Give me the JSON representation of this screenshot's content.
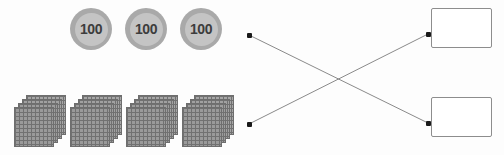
{
  "worksheet": {
    "background_color": "#fdfdfd",
    "width": 504,
    "height": 155
  },
  "coins": {
    "group_name": "hundred-coins",
    "count": 3,
    "face_color": "#c4c4c4",
    "rim_color": "#a9a9a9",
    "text_color": "#3d3d3d",
    "items": [
      {
        "value": "100",
        "x": 70,
        "y": 8
      },
      {
        "value": "100",
        "x": 125,
        "y": 8
      },
      {
        "value": "100",
        "x": 180,
        "y": 8
      }
    ]
  },
  "blocks": {
    "group_name": "hundred-flats",
    "count": 4,
    "rows": 10,
    "columns": 10,
    "fill_color": "#9a9a9a",
    "grid_line_color": "#717171",
    "items": [
      {
        "x": 14,
        "y": 95
      },
      {
        "x": 70,
        "y": 95
      },
      {
        "x": 126,
        "y": 95
      },
      {
        "x": 182,
        "y": 95
      }
    ]
  },
  "matching": {
    "left_dots": [
      {
        "name": "left-dot-top",
        "x": 247,
        "y": 33
      },
      {
        "name": "left-dot-bottom",
        "x": 247,
        "y": 122
      }
    ],
    "right_dots": [
      {
        "name": "right-dot-top",
        "x": 426,
        "y": 32
      },
      {
        "name": "right-dot-bottom",
        "x": 426,
        "y": 121
      }
    ],
    "lines": [
      {
        "name": "connector-line-top-to-bottom",
        "x1": 249,
        "y1": 35,
        "x2": 428,
        "y2": 123
      },
      {
        "name": "connector-line-bottom-to-top",
        "x1": 249,
        "y1": 124,
        "x2": 428,
        "y2": 34
      }
    ],
    "line_color": "#8a8a8a",
    "dot_color": "#1a1a1a"
  },
  "answer_boxes": {
    "border_color": "#8d8d8d",
    "fill_color": "#ffffff",
    "items": [
      {
        "name": "answer-box-top",
        "value": "",
        "x": 431,
        "y": 8,
        "width": 61,
        "height": 40
      },
      {
        "name": "answer-box-bottom",
        "value": "",
        "x": 431,
        "y": 97,
        "width": 61,
        "height": 40
      }
    ]
  }
}
